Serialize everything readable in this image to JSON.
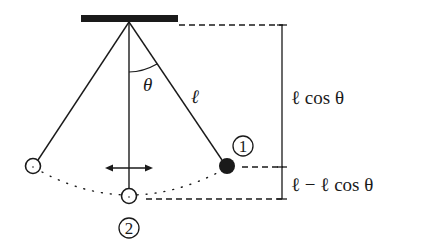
{
  "diagram": {
    "colors": {
      "ink": "#1a1a1a",
      "background": "#ffffff"
    },
    "labels": {
      "angle": "θ",
      "length": "ℓ",
      "height_upper": "ℓ cos θ",
      "height_lower": "ℓ − ℓ cos θ",
      "position_1": "1",
      "position_2": "2"
    },
    "elements": {
      "support": "ceiling-support-bar",
      "bobs": [
        {
          "name": "left-extreme-bob",
          "filled": false
        },
        {
          "name": "bottom-bob-2",
          "filled": false
        },
        {
          "name": "right-bob-1",
          "filled": true
        }
      ],
      "arrow": "horizontal-double-arrow",
      "path": "dotted-swing-arc"
    }
  }
}
